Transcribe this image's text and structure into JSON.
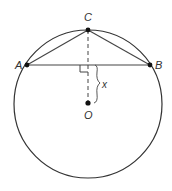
{
  "diagram": {
    "type": "circle-geometry",
    "circle": {
      "center": "O",
      "cx": 88,
      "cy": 104,
      "r": 74
    },
    "points": [
      {
        "id": "C",
        "label": "C",
        "x": 88,
        "y": 30,
        "lx": 84,
        "ly": 21
      },
      {
        "id": "A",
        "label": "A",
        "x": 27,
        "y": 65,
        "lx": 15,
        "ly": 69
      },
      {
        "id": "B",
        "label": "B",
        "x": 150,
        "y": 65,
        "lx": 155,
        "ly": 69
      },
      {
        "id": "O",
        "label": "O",
        "x": 88,
        "y": 103,
        "lx": 84,
        "ly": 119
      }
    ],
    "segments": [
      "AB",
      "AC",
      "CB"
    ],
    "dashed_segment": "CO",
    "right_angle_at": "intersection of CO and AB",
    "brace_label": "x",
    "stroke_color": "#333333"
  }
}
